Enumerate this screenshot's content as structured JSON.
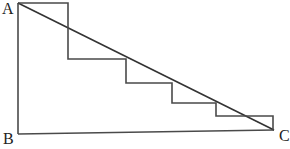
{
  "diagram": {
    "labels": {
      "a": "A",
      "b": "B",
      "c": "C"
    },
    "points": {
      "A": [
        18,
        3
      ],
      "B": [
        18,
        134
      ],
      "C": [
        274,
        130
      ]
    },
    "staircase": [
      [
        18,
        3
      ],
      [
        68,
        3
      ],
      [
        68,
        59
      ],
      [
        126,
        59
      ],
      [
        126,
        83
      ],
      [
        172,
        83
      ],
      [
        172,
        103
      ],
      [
        216,
        103
      ],
      [
        216,
        116
      ],
      [
        273,
        116
      ],
      [
        273,
        130
      ]
    ],
    "colors": {
      "stroke": "#4a4a4a",
      "background": "#ffffff",
      "text": "#222222"
    }
  }
}
